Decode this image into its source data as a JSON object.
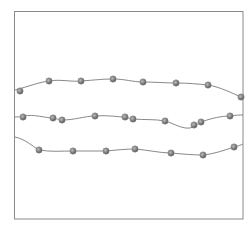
{
  "figure": {
    "frame": {
      "x": 14.5,
      "y": 11.5,
      "width": 228.5,
      "height": 207.5,
      "stroke": "#8a8a8a"
    },
    "colors": {
      "background": "#ffffff",
      "strand": "#7a7a7a",
      "bead_dark": "#4a4a4a",
      "bead_light": "#bdbdbd"
    },
    "strands": [
      {
        "name": "strand-top",
        "path": "M15,90 C30,86 40,82 49,81 C60,79 70,82 81,81 C95,80 103,79 113,79 C125,79 133,82 143,82 C155,82 165,83 176,83 C188,83 198,84 208,85 C220,87 232,93 243,98",
        "beads": [
          [
            20,
            91
          ],
          [
            49,
            81
          ],
          [
            81,
            81
          ],
          [
            113,
            79
          ],
          [
            143,
            82
          ],
          [
            176,
            83
          ],
          [
            208,
            85
          ],
          [
            241,
            97
          ]
        ]
      },
      {
        "name": "strand-middle",
        "path": "M15,117 C20,117 22,116 23,116 C35,114 45,118 53,118 C58,119 60,120 62,120 C75,120 85,116 95,116 C108,115 118,117 125,117 C129,118 131,119 133,119 C145,120 155,119 165,121 C175,124 182,129 190,128 C195,127 198,123 201,122 C212,118 222,116 230,116 C236,115 240,115 243,115",
        "beads": [
          [
            23,
            117
          ],
          [
            53,
            118
          ],
          [
            62,
            120
          ],
          [
            95,
            116
          ],
          [
            125,
            117
          ],
          [
            133,
            119
          ],
          [
            165,
            121
          ],
          [
            194,
            125
          ],
          [
            201,
            122
          ],
          [
            230,
            116
          ]
        ]
      },
      {
        "name": "strand-bottom",
        "path": "M15,137 C25,139 32,146 39,150 C50,152 62,151 73,151 C85,151 95,151 106,151 C117,150 126,149 135,149 C148,150 160,153 171,153 C182,154 193,155 203,155 C214,154 225,150 234,147 C238,146 241,145 243,144",
        "beads": [
          [
            39,
            150
          ],
          [
            73,
            151
          ],
          [
            106,
            151
          ],
          [
            135,
            149
          ],
          [
            171,
            153
          ],
          [
            203,
            155
          ],
          [
            234,
            147
          ]
        ]
      }
    ],
    "bead_radius": 3.2
  }
}
